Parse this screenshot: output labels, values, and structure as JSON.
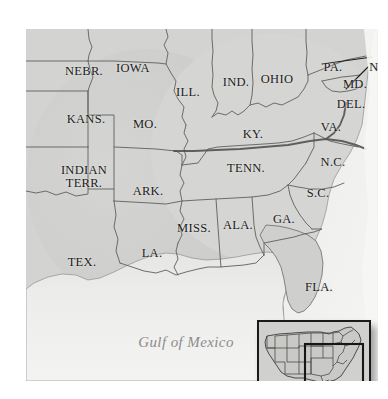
{
  "figure": {
    "background_color": "#ffffff",
    "land_color": "#d2d2d0",
    "land_shaded_color": "#c2c2c0",
    "water_color": "#eeeeec",
    "border_color": "#5a5a5a",
    "label_color": "#1b1b1b",
    "water_label_color": "#8c8c8c",
    "heavy_line_color": "#4a4a4a"
  },
  "map": {
    "water_labels": [
      {
        "name": "gulf-of-mexico",
        "text": "Gulf of Mexico",
        "x": 160,
        "y": 313
      }
    ],
    "state_labels": [
      {
        "name": "nebraska",
        "text": "NEBR.",
        "x": 58,
        "y": 42,
        "lines": 1
      },
      {
        "name": "iowa",
        "text": "IOWA",
        "x": 107,
        "y": 39,
        "lines": 1
      },
      {
        "name": "illinois",
        "text": "ILL.",
        "x": 162,
        "y": 63,
        "lines": 1
      },
      {
        "name": "indiana",
        "text": "IND.",
        "x": 210,
        "y": 53,
        "lines": 1
      },
      {
        "name": "ohio",
        "text": "OHIO",
        "x": 251,
        "y": 50,
        "lines": 1
      },
      {
        "name": "pennsylvania",
        "text": "PA.",
        "x": 307,
        "y": 38,
        "lines": 1
      },
      {
        "name": "new-jersey",
        "text": "N.J.",
        "x": 354,
        "y": 38,
        "lines": 1
      },
      {
        "name": "maryland",
        "text": "MD.",
        "x": 329,
        "y": 55,
        "lines": 1
      },
      {
        "name": "delaware",
        "text": "DEL.",
        "x": 325,
        "y": 75,
        "lines": 1
      },
      {
        "name": "virginia",
        "text": "VA.",
        "x": 305,
        "y": 98,
        "lines": 1
      },
      {
        "name": "kansas",
        "text": "KANS.",
        "x": 60,
        "y": 90,
        "lines": 1
      },
      {
        "name": "missouri",
        "text": "MO.",
        "x": 119,
        "y": 95,
        "lines": 1
      },
      {
        "name": "kentucky",
        "text": "KY.",
        "x": 227,
        "y": 105,
        "lines": 1
      },
      {
        "name": "tennessee",
        "text": "TENN.",
        "x": 220,
        "y": 139,
        "lines": 1
      },
      {
        "name": "north-carolina",
        "text": "N.C.",
        "x": 307,
        "y": 133,
        "lines": 1
      },
      {
        "name": "indian-territory",
        "text": "INDIAN\nTERR.",
        "x": 58,
        "y": 148,
        "lines": 2
      },
      {
        "name": "arkansas",
        "text": "ARK.",
        "x": 122,
        "y": 162,
        "lines": 1
      },
      {
        "name": "south-carolina",
        "text": "S.C.",
        "x": 292,
        "y": 164,
        "lines": 1
      },
      {
        "name": "mississippi",
        "text": "MISS.",
        "x": 168,
        "y": 199,
        "lines": 1
      },
      {
        "name": "alabama",
        "text": "ALA.",
        "x": 212,
        "y": 196,
        "lines": 1
      },
      {
        "name": "georgia",
        "text": "GA.",
        "x": 258,
        "y": 190,
        "lines": 1
      },
      {
        "name": "louisiana",
        "text": "LA.",
        "x": 126,
        "y": 224,
        "lines": 1
      },
      {
        "name": "texas",
        "text": "TEX.",
        "x": 56,
        "y": 233,
        "lines": 1
      },
      {
        "name": "florida",
        "text": "FLA.",
        "x": 293,
        "y": 258,
        "lines": 1
      }
    ]
  },
  "inset": {
    "name": "united-states-locator-inset",
    "description": "Locator inset of the continental United States with the detail area outlined",
    "highlight_region": "southeastern United States"
  }
}
